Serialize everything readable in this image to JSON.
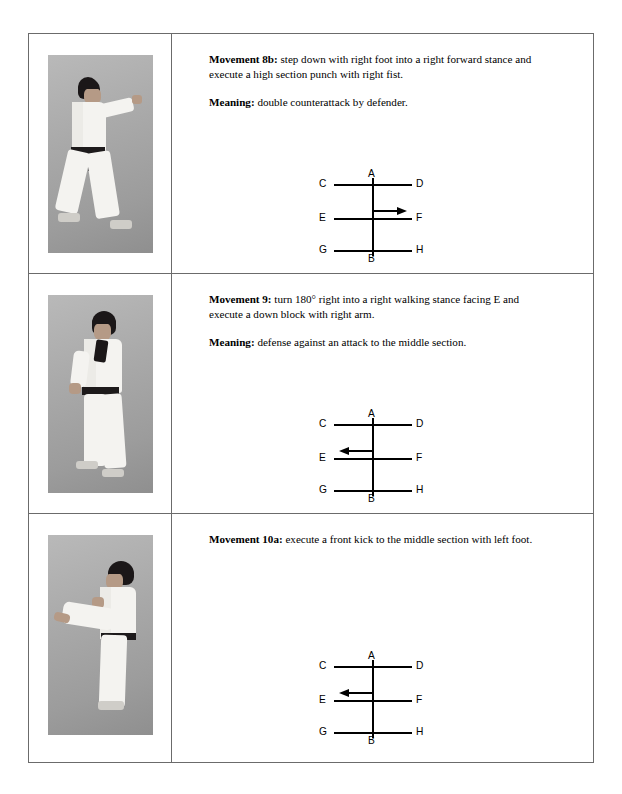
{
  "page": {
    "border_color": "#6b6b6b"
  },
  "rows": [
    {
      "id": "movement-8b",
      "photo_alt": "karateka in right forward stance executing a high section punch with right fist",
      "movement_label": "Movement 8b:",
      "movement_text": " step down with right foot into a right forward stance and execute a high section punch with right fist.",
      "meaning_label": "Meaning:",
      "meaning_text": " double counterattack by defender.",
      "has_meaning": true,
      "diagram": {
        "labels": {
          "A": "A",
          "B": "B",
          "C": "C",
          "D": "D",
          "E": "E",
          "F": "F",
          "G": "G",
          "H": "H"
        },
        "arrow_direction": "right",
        "arrow_from": "center",
        "arrow_to": "F"
      }
    },
    {
      "id": "movement-9",
      "photo_alt": "karateka in right walking stance executing a down block with right arm",
      "movement_label": "Movement 9:",
      "movement_text": " turn 180° right into a right walking stance facing E and execute a down block with right arm.",
      "meaning_label": "Meaning:",
      "meaning_text": " defense against an attack to the middle section.",
      "has_meaning": true,
      "diagram": {
        "labels": {
          "A": "A",
          "B": "B",
          "C": "C",
          "D": "D",
          "E": "E",
          "F": "F",
          "G": "G",
          "H": "H"
        },
        "arrow_direction": "left",
        "arrow_from": "center",
        "arrow_to": "E"
      }
    },
    {
      "id": "movement-10a",
      "photo_alt": "karateka executing a front kick to the middle section with left foot",
      "movement_label": "Movement 10a:",
      "movement_text": " execute a front kick to the middle section with left foot.",
      "meaning_label": "",
      "meaning_text": "",
      "has_meaning": false,
      "diagram": {
        "labels": {
          "A": "A",
          "B": "B",
          "C": "C",
          "D": "D",
          "E": "E",
          "F": "F",
          "G": "G",
          "H": "H"
        },
        "arrow_direction": "left",
        "arrow_from": "center",
        "arrow_to": "E"
      }
    }
  ]
}
